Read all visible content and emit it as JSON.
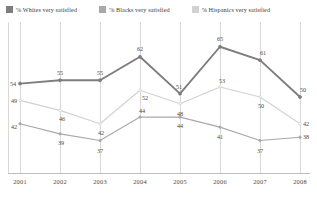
{
  "legend": {
    "position": "top",
    "items": [
      {
        "label": "% Whites very  satisfied",
        "color": "#7d7d7d",
        "icon": "legend-swatch-icon"
      },
      {
        "label": "% Blacks very satisfied",
        "color": "#a9a9a9",
        "icon": "legend-swatch-icon"
      },
      {
        "label": "% Hispanics very satisfied",
        "color": "#d2d2d2",
        "icon": "legend-swatch-icon"
      }
    ]
  },
  "chart_data": {
    "type": "line",
    "title": "",
    "subtitle": "",
    "xlabel": "",
    "ylabel": "",
    "grid": true,
    "legend_position": "top",
    "categories": [
      "2001",
      "2002",
      "2003",
      "2004",
      "2005",
      "2006",
      "2007",
      "2008"
    ],
    "x": [
      2001,
      2002,
      2003,
      2004,
      2005,
      2006,
      2007,
      2008
    ],
    "ylim": [
      30,
      70
    ],
    "series": [
      {
        "name": "% Whites very  satisfied",
        "color": "#7d7d7d",
        "values": [
          54,
          55,
          55,
          62,
          51,
          65,
          61,
          50
        ],
        "labels": [
          "54",
          "55",
          "55",
          "62",
          "51",
          "65",
          "61",
          "50"
        ]
      },
      {
        "name": "% Blacks very satisfied",
        "color": "#a9a9a9",
        "values": [
          42,
          39,
          37,
          44,
          44,
          41,
          37,
          38
        ],
        "labels": [
          "42",
          "39",
          "37",
          "44",
          "44",
          "41",
          "37",
          "38"
        ]
      },
      {
        "name": "% Hispanics very satisfied",
        "color": "#d2d2d2",
        "values": [
          49,
          46,
          42,
          52,
          48,
          53,
          50,
          42
        ],
        "labels": [
          "49",
          "46",
          "42",
          "52",
          "48",
          "53",
          "50",
          "42"
        ]
      }
    ]
  }
}
